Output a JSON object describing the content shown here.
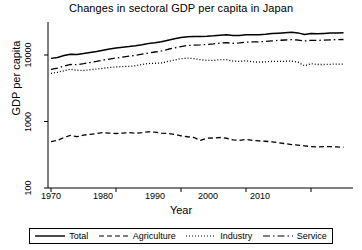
{
  "chart_data": {
    "type": "line",
    "title": "Changes in sectoral GDP per capita in Japan",
    "xlabel": "Year",
    "ylabel": "GDP per capita",
    "yscale": "log",
    "ylim": [
      100,
      30000
    ],
    "xlim": [
      1970,
      2015
    ],
    "yticks": [
      100,
      1000,
      10000
    ],
    "ytick_labels": [
      "100",
      "1000",
      "10000"
    ],
    "xticks": [
      1970,
      1980,
      1990,
      2000,
      2010
    ],
    "xtick_labels": [
      "1970",
      "1980",
      "1990",
      "2000",
      "2010"
    ],
    "grid": false,
    "legend_position": "bottom",
    "x": [
      1970,
      1971,
      1972,
      1973,
      1974,
      1975,
      1976,
      1977,
      1978,
      1979,
      1980,
      1981,
      1982,
      1983,
      1984,
      1985,
      1986,
      1987,
      1988,
      1989,
      1990,
      1991,
      1992,
      1993,
      1994,
      1995,
      1996,
      1997,
      1998,
      1999,
      2000,
      2001,
      2002,
      2003,
      2004,
      2005,
      2006,
      2007,
      2008,
      2009,
      2010,
      2011,
      2012,
      2013,
      2014,
      2015
    ],
    "series": [
      {
        "name": "Total",
        "style": "solid",
        "color": "#000000",
        "values": [
          8900,
          9200,
          9800,
          10300,
          10200,
          10500,
          10900,
          11300,
          11800,
          12300,
          12700,
          13100,
          13400,
          13800,
          14300,
          14900,
          15300,
          15800,
          16700,
          17500,
          18300,
          18800,
          19000,
          19000,
          19100,
          19400,
          19900,
          20100,
          19600,
          19700,
          20200,
          20100,
          20200,
          20500,
          21000,
          21300,
          21600,
          21900,
          21500,
          20400,
          21000,
          20900,
          21100,
          21400,
          21500,
          21700
        ]
      },
      {
        "name": "Agriculture",
        "style": "dashed",
        "color": "#000000",
        "values": [
          500,
          520,
          575,
          620,
          590,
          625,
          640,
          660,
          680,
          670,
          660,
          670,
          680,
          665,
          680,
          700,
          690,
          670,
          660,
          640,
          610,
          590,
          575,
          520,
          560,
          565,
          575,
          560,
          530,
          520,
          540,
          520,
          510,
          505,
          495,
          480,
          465,
          450,
          440,
          430,
          420,
          415,
          420,
          420,
          415,
          410
        ]
      },
      {
        "name": "Industry",
        "style": "dotted",
        "color": "#000000",
        "values": [
          5300,
          5500,
          5800,
          6100,
          5900,
          5850,
          6000,
          6150,
          6300,
          6500,
          6600,
          6700,
          6750,
          6900,
          7200,
          7500,
          7500,
          7600,
          8000,
          8400,
          8800,
          9000,
          8800,
          8500,
          8300,
          8300,
          8500,
          8500,
          8100,
          8000,
          8200,
          7900,
          7800,
          7900,
          8000,
          8000,
          8050,
          8100,
          7800,
          6900,
          7400,
          7200,
          7200,
          7250,
          7300,
          7300
        ]
      },
      {
        "name": "Service",
        "style": "dashdot",
        "color": "#000000",
        "values": [
          6100,
          6350,
          6800,
          7200,
          7150,
          7400,
          7700,
          8000,
          8400,
          8700,
          9000,
          9300,
          9600,
          9900,
          10300,
          10700,
          11100,
          11500,
          12200,
          12800,
          13400,
          13900,
          14100,
          14200,
          14400,
          14700,
          15100,
          15300,
          15000,
          15200,
          15600,
          15700,
          15800,
          16000,
          16300,
          16600,
          16800,
          17000,
          16800,
          16300,
          16600,
          16600,
          16700,
          16900,
          17000,
          17100
        ]
      }
    ],
    "legend": [
      {
        "label": "Total",
        "style": "solid"
      },
      {
        "label": "Agriculture",
        "style": "dashed"
      },
      {
        "label": "Industry",
        "style": "dotted"
      },
      {
        "label": "Service",
        "style": "dashdot"
      }
    ]
  }
}
